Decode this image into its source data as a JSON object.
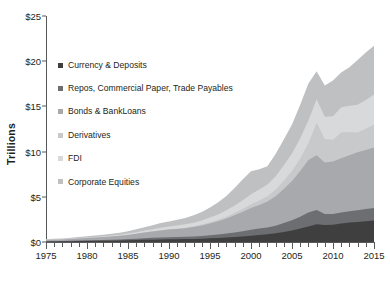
{
  "chart_data": {
    "type": "area",
    "stacked": true,
    "title": "",
    "subtitle": "",
    "xlabel": "",
    "ylabel": "Trillions",
    "xlim": [
      1975,
      2015
    ],
    "ylim": [
      0,
      25
    ],
    "ytick_labels": [
      "$0",
      "$5",
      "$10",
      "$15",
      "$20",
      "$25"
    ],
    "ytick_values": [
      0,
      5,
      10,
      15,
      20,
      25
    ],
    "xtick_labels": [
      "1975",
      "1980",
      "1985",
      "1990",
      "1995",
      "2000",
      "2005",
      "2010",
      "2015"
    ],
    "xtick_values": [
      1975,
      1980,
      1985,
      1990,
      1995,
      2000,
      2005,
      2010,
      2015
    ],
    "xtick_interval_minor": 1,
    "grid": false,
    "legend_position": "inside-upper-left",
    "x": [
      1975,
      1976,
      1977,
      1978,
      1979,
      1980,
      1981,
      1982,
      1983,
      1984,
      1985,
      1986,
      1987,
      1988,
      1989,
      1990,
      1991,
      1992,
      1993,
      1994,
      1995,
      1996,
      1997,
      1998,
      1999,
      2000,
      2001,
      2002,
      2003,
      2004,
      2005,
      2006,
      2007,
      2008,
      2009,
      2010,
      2011,
      2012,
      2013,
      2014,
      2015
    ],
    "series": [
      {
        "name": "Currency & Deposits",
        "color": "#3f3f3f",
        "values": [
          0.05,
          0.06,
          0.07,
          0.08,
          0.1,
          0.11,
          0.12,
          0.13,
          0.15,
          0.16,
          0.18,
          0.21,
          0.24,
          0.26,
          0.28,
          0.3,
          0.31,
          0.32,
          0.34,
          0.37,
          0.41,
          0.45,
          0.5,
          0.56,
          0.62,
          0.7,
          0.78,
          0.86,
          0.97,
          1.12,
          1.28,
          1.48,
          1.72,
          1.95,
          1.88,
          1.92,
          2.05,
          2.15,
          2.22,
          2.3,
          2.38
        ]
      },
      {
        "name": "Repos, Commercial Paper, Trade Payables",
        "color": "#6d6e71",
        "values": [
          0.04,
          0.05,
          0.05,
          0.06,
          0.07,
          0.08,
          0.09,
          0.1,
          0.11,
          0.12,
          0.14,
          0.16,
          0.18,
          0.2,
          0.22,
          0.23,
          0.24,
          0.25,
          0.27,
          0.3,
          0.34,
          0.38,
          0.44,
          0.5,
          0.57,
          0.65,
          0.7,
          0.75,
          0.84,
          0.97,
          1.12,
          1.32,
          1.55,
          1.6,
          1.22,
          1.18,
          1.22,
          1.26,
          1.3,
          1.34,
          1.38
        ]
      },
      {
        "name": "Bonds & BankLoans",
        "color": "#a7a9ac",
        "values": [
          0.12,
          0.14,
          0.16,
          0.19,
          0.22,
          0.25,
          0.28,
          0.31,
          0.35,
          0.4,
          0.46,
          0.54,
          0.62,
          0.7,
          0.78,
          0.84,
          0.9,
          0.96,
          1.05,
          1.16,
          1.3,
          1.46,
          1.66,
          1.9,
          2.16,
          2.42,
          2.62,
          2.86,
          3.25,
          3.78,
          4.35,
          5.05,
          5.8,
          6.05,
          5.7,
          5.8,
          6.0,
          6.2,
          6.4,
          6.55,
          6.7
        ]
      },
      {
        "name": "Derivatives",
        "color": "#c8c9cb",
        "values": [
          0.0,
          0.0,
          0.0,
          0.0,
          0.0,
          0.0,
          0.0,
          0.0,
          0.0,
          0.0,
          0.01,
          0.01,
          0.02,
          0.02,
          0.03,
          0.04,
          0.05,
          0.06,
          0.08,
          0.1,
          0.13,
          0.16,
          0.2,
          0.26,
          0.32,
          0.4,
          0.48,
          0.58,
          0.72,
          0.9,
          1.1,
          1.4,
          1.85,
          3.6,
          2.6,
          2.4,
          2.85,
          2.55,
          2.2,
          2.35,
          2.55
        ]
      },
      {
        "name": "FDI",
        "color": "#d8d9da",
        "values": [
          0.03,
          0.03,
          0.04,
          0.05,
          0.06,
          0.07,
          0.08,
          0.09,
          0.1,
          0.12,
          0.14,
          0.17,
          0.2,
          0.24,
          0.28,
          0.31,
          0.33,
          0.36,
          0.4,
          0.45,
          0.52,
          0.6,
          0.7,
          0.82,
          0.96,
          1.12,
          1.22,
          1.32,
          1.5,
          1.72,
          1.95,
          2.22,
          2.52,
          2.6,
          2.45,
          2.62,
          2.78,
          2.92,
          3.05,
          3.18,
          3.3
        ]
      },
      {
        "name": "Corporate Equities",
        "color": "#bfc0c2",
        "values": [
          0.06,
          0.07,
          0.08,
          0.09,
          0.11,
          0.13,
          0.14,
          0.16,
          0.19,
          0.22,
          0.26,
          0.32,
          0.38,
          0.44,
          0.52,
          0.56,
          0.62,
          0.7,
          0.82,
          0.94,
          1.12,
          1.34,
          1.6,
          1.92,
          2.3,
          2.55,
          2.25,
          2.0,
          2.45,
          2.85,
          3.2,
          3.7,
          4.1,
          3.1,
          3.45,
          3.95,
          3.85,
          4.25,
          4.95,
          5.25,
          5.4
        ]
      }
    ]
  },
  "legend": {
    "items": [
      {
        "label": "Currency & Deposits"
      },
      {
        "label": "Repos, Commercial Paper, Trade Payables"
      },
      {
        "label": "Bonds & BankLoans"
      },
      {
        "label": "Derivatives"
      },
      {
        "label": "FDI"
      },
      {
        "label": "Corporate Equities"
      }
    ]
  }
}
